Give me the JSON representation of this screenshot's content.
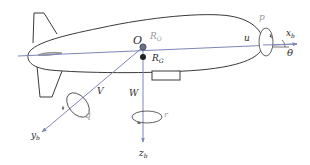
{
  "figure": {
    "labels": {
      "origin": "O",
      "center_of_volume": "R",
      "center_of_volume_sub": "O",
      "center_of_gravity": "R",
      "center_of_gravity_sub": "G",
      "x_axis": "x",
      "x_axis_sub": "b",
      "y_axis": "y",
      "y_axis_sub": "b",
      "z_axis": "z",
      "z_axis_sub": "b",
      "surge_velocity": "u",
      "sway_velocity": "V",
      "heave_velocity": "W",
      "roll_rate": "p",
      "pitch_rate": "q",
      "yaw_rate": "r",
      "pitch_angle": "θ"
    },
    "colors": {
      "outline": "#3a3a3a",
      "axis": "#7f86b8",
      "point_o": "#6a6f8a",
      "point_g": "#222222"
    }
  }
}
